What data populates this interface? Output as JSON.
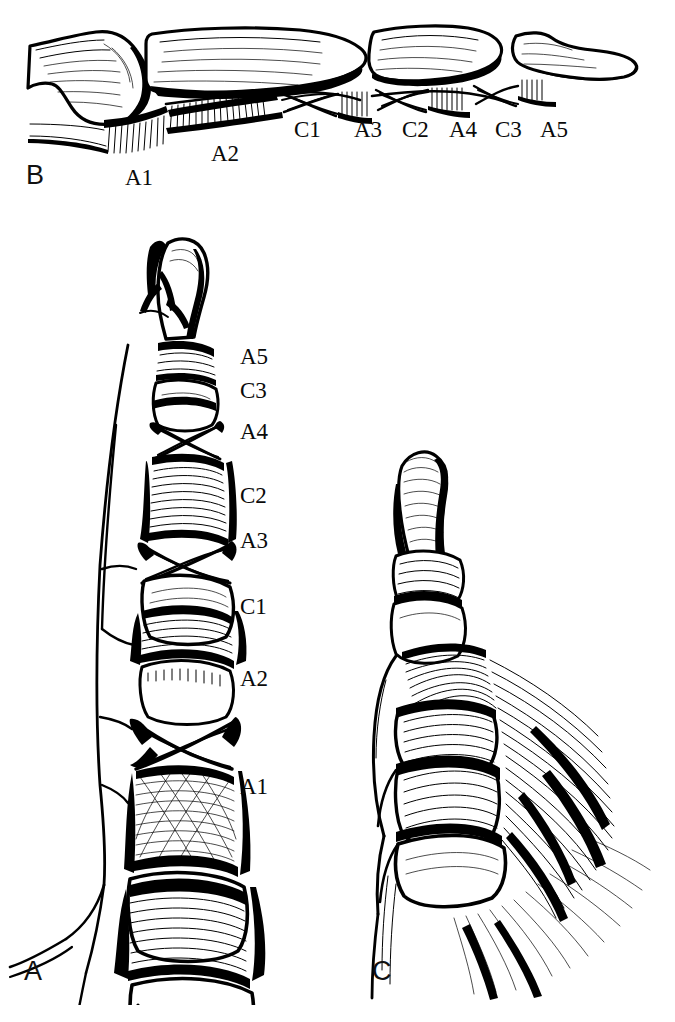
{
  "figure": {
    "background_color": "#ffffff",
    "ink_color": "#000000",
    "width": 675,
    "height": 1022
  },
  "panels": [
    {
      "id": "B",
      "letter": "B",
      "view": "lateral view of finger skeleton with annular and cruciate pulleys",
      "letter_pos": {
        "x": 26,
        "y": 162
      }
    },
    {
      "id": "A",
      "letter": "A",
      "view": "volar (palmar) view of finger flexor sheath",
      "letter_pos": {
        "x": 24,
        "y": 958
      }
    },
    {
      "id": "C",
      "letter": "C",
      "view": "oblique view of finger with flexor sheath and palmar aponeurosis",
      "letter_pos": {
        "x": 372,
        "y": 958
      }
    }
  ],
  "labels_panel_b": [
    {
      "text": "C1",
      "x": 294,
      "y": 118
    },
    {
      "text": "A3",
      "x": 354,
      "y": 118
    },
    {
      "text": "A4",
      "x": 449,
      "y": 118
    },
    {
      "text": "C2",
      "x": 402,
      "y": 118
    },
    {
      "text": "C3",
      "x": 495,
      "y": 118
    },
    {
      "text": "A5",
      "x": 540,
      "y": 118
    },
    {
      "text": "A2",
      "x": 211,
      "y": 142
    },
    {
      "text": "A1",
      "x": 125,
      "y": 166
    }
  ],
  "labels_panel_a": [
    {
      "text": "A5",
      "x": 240,
      "y": 345
    },
    {
      "text": "C3",
      "x": 240,
      "y": 379
    },
    {
      "text": "A4",
      "x": 240,
      "y": 420
    },
    {
      "text": "C2",
      "x": 240,
      "y": 484
    },
    {
      "text": "A3",
      "x": 240,
      "y": 529
    },
    {
      "text": "C1",
      "x": 240,
      "y": 595
    },
    {
      "text": "A2",
      "x": 240,
      "y": 667
    },
    {
      "text": "A1",
      "x": 240,
      "y": 775
    }
  ],
  "legend_terms": {
    "A1": "first annular pulley",
    "A2": "second annular pulley",
    "A3": "third annular pulley",
    "A4": "fourth annular pulley",
    "A5": "fifth annular pulley",
    "C1": "first cruciate pulley",
    "C2": "second cruciate pulley",
    "C3": "third cruciate pulley"
  },
  "caption": {
    "text": ""
  }
}
